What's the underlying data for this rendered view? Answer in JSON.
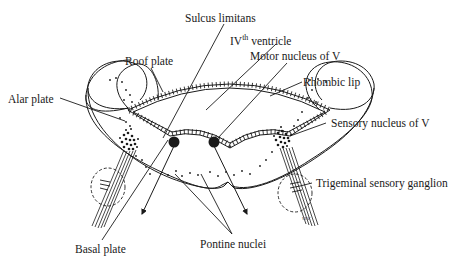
{
  "figure": {
    "labels": {
      "sulcus_limitans": "Sulcus limitans",
      "ivth_ventricle_prefix": "IV",
      "ivth_ventricle_sup": "th",
      "ivth_ventricle_suffix": " ventricle",
      "roof_plate": "Roof plate",
      "motor_nucleus": "Motor nucleus of V",
      "rhombic_lip": "Rhombic lip",
      "alar_plate": "Alar plate",
      "sensory_nucleus": "Sensory nucleus of V",
      "trigeminal_ganglion": "Trigeminal sensory ganglion",
      "basal_plate": "Basal plate",
      "pontine_nuclei": "Pontine nuclei",
      "signature": "vnc"
    },
    "colors": {
      "ink": "#1a1a1a",
      "background": "#ffffff"
    }
  }
}
